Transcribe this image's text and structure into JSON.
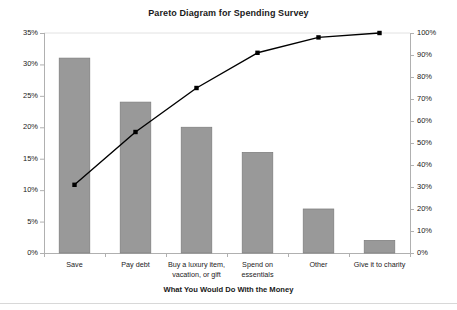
{
  "chart_data": {
    "type": "bar",
    "title": "Pareto Diagram for Spending Survey",
    "xlabel": "What You Would Do With the Money",
    "ylabel": "",
    "categories": [
      "Save",
      "Pay debt",
      "Buy a luxury item, vacation, or gift",
      "Spend on essentials",
      "Other",
      "Give it to charity"
    ],
    "series": [
      {
        "name": "Percent of respondents",
        "type": "bar",
        "axis": "left",
        "values": [
          31,
          24,
          20,
          16,
          7,
          2
        ]
      },
      {
        "name": "Cumulative percent",
        "type": "line",
        "axis": "right",
        "values": [
          31,
          55,
          75,
          91,
          98,
          100
        ]
      }
    ],
    "ylim": [
      0,
      35
    ],
    "y2lim": [
      0,
      100
    ],
    "yticks": [
      "0%",
      "5%",
      "10%",
      "15%",
      "20%",
      "25%",
      "30%",
      "35%"
    ],
    "ytick_values": [
      0,
      5,
      10,
      15,
      20,
      25,
      30,
      35
    ],
    "y2ticks": [
      "0%",
      "10%",
      "20%",
      "30%",
      "40%",
      "50%",
      "60%",
      "70%",
      "80%",
      "90%",
      "100%"
    ],
    "y2tick_values": [
      0,
      10,
      20,
      30,
      40,
      50,
      60,
      70,
      80,
      90,
      100
    ],
    "grid": false,
    "legend": "none",
    "bar_color": "#999999",
    "bar_edge_color": "#808080",
    "line_color": "#000000",
    "marker": "square",
    "axis_color": "#b0b0b0"
  },
  "categories_display": [
    [
      "Save"
    ],
    [
      "Pay debt"
    ],
    [
      "Buy a luxury item,",
      "vacation, or gift"
    ],
    [
      "Spend on",
      "essentials"
    ],
    [
      "Other"
    ],
    [
      "Give it to charity"
    ]
  ]
}
